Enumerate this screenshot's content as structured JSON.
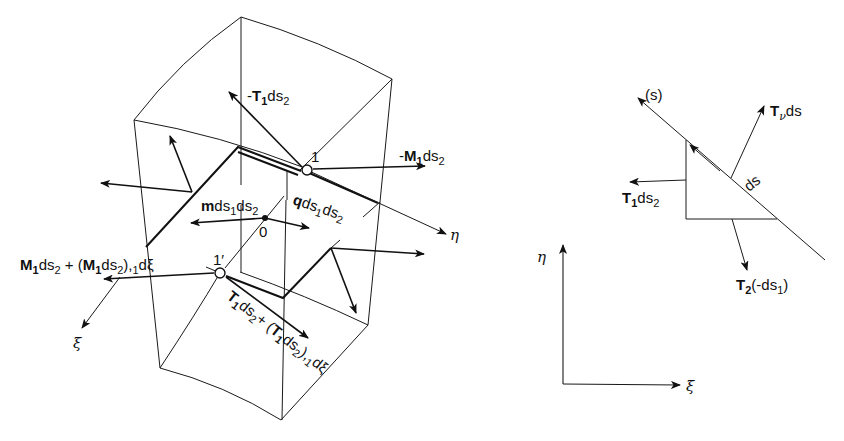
{
  "figure": {
    "left_panel": {
      "labels": {
        "neg_T1_ds2": {
          "prefix": "-",
          "sym": "T",
          "sub": "1",
          "rest": "ds",
          "sub2": "2"
        },
        "neg_M1_ds2": {
          "prefix": "-",
          "sym": "M",
          "sub": "1",
          "rest": "ds",
          "sub2": "2"
        },
        "node_1": "1",
        "node_1_prime": "1′",
        "point_0": "0",
        "m_ds1_ds2": {
          "sym": "m",
          "rest1": "ds",
          "sub1": "1",
          "rest2": "ds",
          "sub2": "2"
        },
        "q_ds1_ds2": {
          "sym": "q",
          "rest1": "ds",
          "sub1": "1",
          "rest2": "ds",
          "sub2": "2"
        },
        "eta_axis": "η",
        "xi_axis": "ξ",
        "M_expr": {
          "a": "M",
          "a_sub": "1",
          "b": "ds",
          "b_sub": "2",
          "plus": " + (",
          "c": "M",
          "c_sub": "1",
          "d": "ds",
          "d_sub": "2",
          "e": "),",
          "e_sub": "1",
          "f": "dξ"
        },
        "T_expr": {
          "a": "T",
          "a_sub": "1",
          "b": "ds",
          "b_sub": "2",
          "plus": "+ (",
          "c": "T",
          "c_sub": "1",
          "d": "ds",
          "d_sub": "2",
          "e": "),",
          "e_sub": "1",
          "f": "dξ"
        }
      }
    },
    "right_panel": {
      "labels": {
        "s_line": "(s)",
        "Tnu_ds": {
          "sym": "T",
          "sub": "ν",
          "rest": "ds"
        },
        "ds": "ds",
        "T1_ds2": {
          "sym": "T",
          "sub": "1",
          "rest": "ds",
          "sub2": "2"
        },
        "T2_neg_ds1": {
          "sym": "T",
          "sub": "2",
          "rest": "(-ds",
          "sub2": "1",
          "close": ")"
        }
      }
    },
    "axes_panel": {
      "eta": "η",
      "xi": "ξ"
    }
  }
}
